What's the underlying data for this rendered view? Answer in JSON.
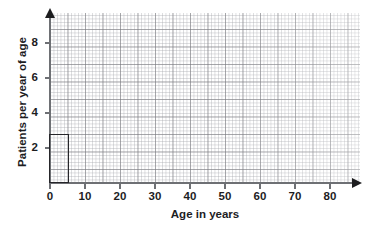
{
  "chart_data": {
    "type": "bar",
    "title": "",
    "xlabel": "Age in years",
    "ylabel": "Patients per year of age",
    "xlim": [
      0,
      87
    ],
    "ylim": [
      0,
      9.7
    ],
    "xticks": [
      0,
      10,
      20,
      30,
      40,
      50,
      60,
      70,
      80
    ],
    "yticks": [
      2,
      4,
      6,
      8
    ],
    "grid": true,
    "grid_style": "graph-paper",
    "legend": null,
    "bars": [
      {
        "label": "0-5",
        "x_start": 0,
        "x_end": 5,
        "value": 2.8
      }
    ],
    "categories": [
      "0-5"
    ],
    "values": [
      2.8
    ],
    "colors": {
      "bar_outline": "#26262a",
      "bar_fill": "transparent",
      "axis": "#6e7074",
      "arrow": "#1d1d1f",
      "text": "#1d1d1f",
      "grid_major": "#787a7d",
      "grid_minor": "#a8aab0",
      "background": "#ffffff"
    }
  },
  "axis_labels": {
    "x_title": "Age in years",
    "y_title": "Patients per year of age",
    "x_ticks": [
      "0",
      "10",
      "20",
      "30",
      "40",
      "50",
      "60",
      "70",
      "80"
    ],
    "y_ticks": [
      "8",
      "6",
      "4",
      "2"
    ]
  }
}
